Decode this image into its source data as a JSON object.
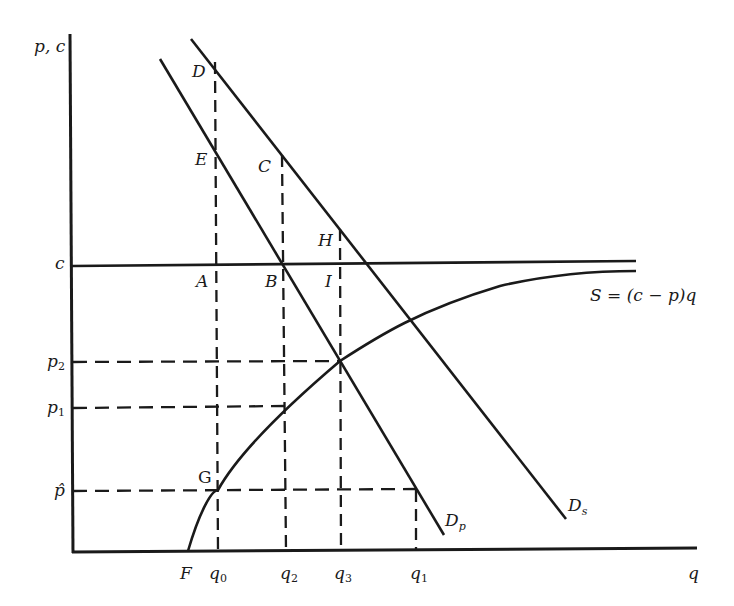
{
  "diagram": {
    "axes": {
      "y_label": "p, c",
      "x_label": "q"
    },
    "y_ticks": [
      {
        "id": "c",
        "base": "c",
        "sub": ""
      },
      {
        "id": "p2",
        "base": "p",
        "sub": "2"
      },
      {
        "id": "p1",
        "base": "p",
        "sub": "1"
      },
      {
        "id": "phat",
        "base": "p̂",
        "sub": ""
      }
    ],
    "x_ticks": [
      {
        "id": "F",
        "base": "F",
        "sub": ""
      },
      {
        "id": "q0",
        "base": "q",
        "sub": "0"
      },
      {
        "id": "q2",
        "base": "q",
        "sub": "2"
      },
      {
        "id": "q3",
        "base": "q",
        "sub": "3"
      },
      {
        "id": "q1",
        "base": "q",
        "sub": "1"
      }
    ],
    "points": {
      "D": "D",
      "E": "E",
      "C": "C",
      "H": "H",
      "A": "A",
      "B": "B",
      "I": "I",
      "G": "G"
    },
    "curves": {
      "Dp": {
        "base": "D",
        "sub": "p"
      },
      "Ds": {
        "base": "D",
        "sub": "s"
      },
      "S": "S = (c − p)q"
    },
    "colors": {
      "ink": "#1a1a1a",
      "background": "#ffffff"
    }
  }
}
